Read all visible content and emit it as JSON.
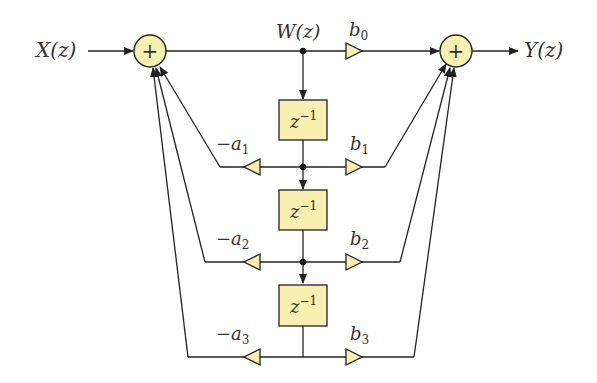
{
  "diagram": {
    "input_label": "X(z)",
    "output_label": "Y(z)",
    "node_label": "W(z)",
    "adder_symbol": "+",
    "delay_label": "z",
    "delay_exp": "−1",
    "feedback_gains": [
      {
        "sign": "−",
        "var": "a",
        "sub": "1"
      },
      {
        "sign": "−",
        "var": "a",
        "sub": "2"
      },
      {
        "sign": "−",
        "var": "a",
        "sub": "3"
      }
    ],
    "feedforward_gains": [
      {
        "var": "b",
        "sub": "0"
      },
      {
        "var": "b",
        "sub": "1"
      },
      {
        "var": "b",
        "sub": "2"
      },
      {
        "var": "b",
        "sub": "3"
      }
    ],
    "colors": {
      "block_fill": "#f7f0b0",
      "stroke": "#222222"
    }
  }
}
